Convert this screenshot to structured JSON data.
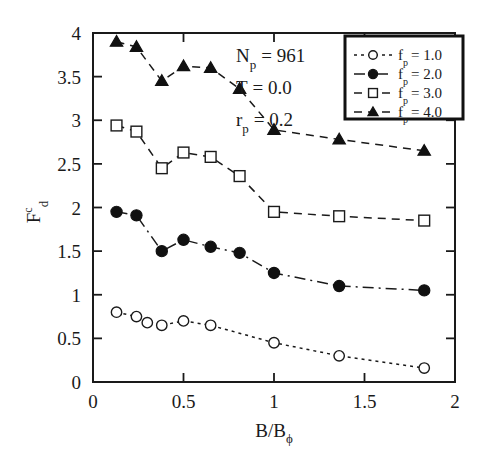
{
  "chart_data": {
    "type": "line",
    "title": "",
    "xlabel": "B/Bϕ",
    "ylabel": "F_d^c",
    "xlim": [
      0,
      2
    ],
    "ylim": [
      0,
      4
    ],
    "xticks": [
      0,
      0.5,
      1,
      1.5,
      2
    ],
    "xtick_labels": [
      "0",
      "0.5",
      "1",
      "1.5",
      "2"
    ],
    "yticks": [
      0,
      0.5,
      1,
      1.5,
      2,
      2.5,
      3,
      3.5,
      4
    ],
    "ytick_labels": [
      "0",
      "0.5",
      "1",
      "1.5",
      "2",
      "2.5",
      "3",
      "3.5",
      "4"
    ],
    "grid": false,
    "legend_position": "top-right",
    "series": [
      {
        "name": "f_p = 1.0",
        "legend_label": "f",
        "legend_sub": "p",
        "legend_value": "= 1.0",
        "marker": "open-circle",
        "linestyle": "dotted",
        "x": [
          0.13,
          0.24,
          0.3,
          0.38,
          0.5,
          0.65,
          1.0,
          1.36,
          1.83
        ],
        "y": [
          0.8,
          0.75,
          0.68,
          0.65,
          0.7,
          0.65,
          0.45,
          0.3,
          0.16
        ]
      },
      {
        "name": "f_p = 2.0",
        "legend_label": "f",
        "legend_sub": "p",
        "legend_value": "= 2.0",
        "marker": "filled-circle",
        "linestyle": "dashdot",
        "x": [
          0.13,
          0.24,
          0.38,
          0.5,
          0.65,
          0.81,
          1.0,
          1.36,
          1.83
        ],
        "y": [
          1.95,
          1.91,
          1.5,
          1.63,
          1.55,
          1.48,
          1.25,
          1.1,
          1.05
        ]
      },
      {
        "name": "f_p = 3.0",
        "legend_label": "f",
        "legend_sub": "p",
        "legend_value": "= 3.0",
        "marker": "open-square",
        "linestyle": "dashed",
        "x": [
          0.13,
          0.24,
          0.38,
          0.5,
          0.65,
          0.81,
          1.0,
          1.36,
          1.83
        ],
        "y": [
          2.94,
          2.87,
          2.45,
          2.63,
          2.58,
          2.36,
          1.95,
          1.9,
          1.85
        ]
      },
      {
        "name": "f_p = 4.0",
        "legend_label": "f",
        "legend_sub": "p",
        "legend_value": "= 4.0",
        "marker": "filled-triangle",
        "linestyle": "dashed",
        "x": [
          0.13,
          0.24,
          0.38,
          0.5,
          0.65,
          0.81,
          1.0,
          1.36,
          1.83
        ],
        "y": [
          3.9,
          3.84,
          3.45,
          3.62,
          3.6,
          3.36,
          2.89,
          2.78,
          2.65
        ]
      }
    ],
    "annotations": [
      {
        "label": "N",
        "sub": "p",
        "value": "= 961"
      },
      {
        "label": "T",
        "sub": "",
        "value": "= 0.0"
      },
      {
        "label": "r",
        "sub": "p",
        "value": "= 0.2"
      }
    ]
  },
  "axes": {
    "y_label_main": "F",
    "y_label_sup": "c",
    "y_label_sub": "d",
    "x_label_main": "B/B",
    "x_label_sub": "ϕ"
  }
}
